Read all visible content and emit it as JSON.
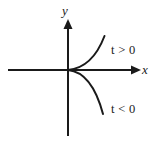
{
  "figure": {
    "type": "cartesian-curve-diagram",
    "background_color": "#ffffff",
    "stroke_color": "#1a1a1a"
  },
  "axes": {
    "x": {
      "label": "x",
      "has_arrow": true,
      "arrow_end": "right",
      "start_px": [
        8,
        70
      ],
      "end_px": [
        140,
        70
      ]
    },
    "y": {
      "label": "y",
      "has_arrow": true,
      "arrow_end": "top",
      "start_px": [
        68,
        136
      ],
      "end_px": [
        68,
        20
      ]
    },
    "origin_px": [
      68,
      70
    ]
  },
  "curve": {
    "description": "cusp curve opening to the right from the origin",
    "branches": [
      {
        "name": "upper-branch",
        "label": "t > 0",
        "label_symbol": "t",
        "label_relation": ">",
        "label_value": "0",
        "path": "M 68 70 C 84 68, 97 56, 104 36"
      },
      {
        "name": "lower-branch",
        "label": "t < 0",
        "label_symbol": "t",
        "label_relation": "<",
        "label_value": "0",
        "path": "M 68 70 C 84 72, 96 86, 103 114"
      }
    ]
  },
  "labels": {
    "y_axis": "y",
    "x_axis": "x",
    "t_positive": "t > 0",
    "t_negative": "t < 0"
  }
}
